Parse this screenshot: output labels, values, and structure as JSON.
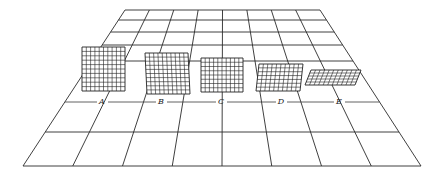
{
  "figure": {
    "floor": {
      "top_y": 10,
      "bottom_y": 166,
      "top_left_x": 125,
      "top_right_x": 320,
      "bottom_left_x": 23,
      "bottom_right_x": 421,
      "columns": 8,
      "row_lines_y": [
        10,
        20,
        32,
        45,
        61,
        102,
        132,
        166
      ]
    },
    "label_line_y": 102,
    "panels": [
      {
        "label": "A",
        "x": 82,
        "y": 47,
        "w": 43,
        "h": 44,
        "skew": 0,
        "cells_x": 10,
        "cells_y": 10,
        "label_x": 102,
        "label_y": 104
      },
      {
        "label": "B",
        "x": 145,
        "y": 53,
        "w": 43,
        "h": 41,
        "skew": 2,
        "cells_x": 10,
        "cells_y": 10,
        "label_x": 161,
        "label_y": 104
      },
      {
        "label": "C",
        "x": 201,
        "y": 58,
        "w": 42,
        "h": 34,
        "skew": 0,
        "cells_x": 10,
        "cells_y": 8,
        "label_x": 221,
        "label_y": 104
      },
      {
        "label": "D",
        "x": 259,
        "y": 64,
        "w": 44,
        "h": 27,
        "skew": -3,
        "cells_x": 10,
        "cells_y": 7,
        "label_x": 281,
        "label_y": 104
      },
      {
        "label": "E",
        "x": 311,
        "y": 70,
        "w": 50,
        "h": 15,
        "skew": -6,
        "cells_x": 11,
        "cells_y": 5,
        "label_x": 339,
        "label_y": 104
      }
    ],
    "colors": {
      "line": "#2a2a2a",
      "background": "#ffffff"
    }
  }
}
